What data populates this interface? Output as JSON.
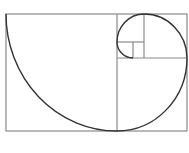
{
  "diagram": {
    "colors": {
      "grid": "#8a8a8a",
      "spiral": "#333333",
      "background": "#ffffff"
    },
    "outer": {
      "x": 6,
      "y": 14,
      "w": 181,
      "h": 117
    },
    "lines": [
      {
        "x1": 117,
        "y1": 14,
        "x2": 117,
        "y2": 131
      },
      {
        "x1": 117,
        "y1": 58,
        "x2": 187,
        "y2": 58
      },
      {
        "x1": 144,
        "y1": 14,
        "x2": 144,
        "y2": 58
      },
      {
        "x1": 117,
        "y1": 42,
        "x2": 144,
        "y2": 42
      },
      {
        "x1": 133,
        "y1": 42,
        "x2": 133,
        "y2": 58
      }
    ],
    "spiral_path": "M6,14 A111,117 0 0 0 117,131 A70,73 0 0 0 187,58 A43,44 0 0 0 144,14 A27,28 0 0 0 117,42 A16,16 0 0 0 133,58"
  }
}
